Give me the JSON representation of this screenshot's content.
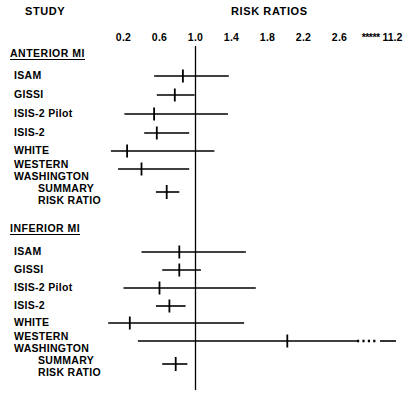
{
  "header": {
    "study_label": "STUDY",
    "risk_ratios_label": "RISK RATIOS"
  },
  "axis": {
    "tick_labels": [
      "0.2",
      "0.6",
      "1.0",
      "1.4",
      "1.8",
      "2.2",
      "2.6"
    ],
    "tick_values": [
      0.2,
      0.6,
      1.0,
      1.4,
      1.8,
      2.2,
      2.6
    ],
    "break_marker": "*****",
    "break_label": "11.2",
    "reference_value": 1.0
  },
  "groups": [
    {
      "title": "ANTERIOR MI",
      "rows": [
        {
          "label": "ISAM",
          "estimate": 0.86,
          "low": 0.54,
          "high": 1.37
        },
        {
          "label": "GISSI",
          "estimate": 0.77,
          "low": 0.57,
          "high": 0.99
        },
        {
          "label": "ISIS-2 Pilot",
          "estimate": 0.54,
          "low": 0.21,
          "high": 1.36
        },
        {
          "label": "ISIS-2",
          "estimate": 0.57,
          "low": 0.43,
          "high": 0.93
        },
        {
          "label": "WHITE",
          "estimate": 0.24,
          "low": 0.06,
          "high": 1.21
        },
        {
          "label": "WESTERN\nWASHINGTON",
          "estimate": 0.4,
          "low": 0.14,
          "high": 0.93
        }
      ],
      "summary": {
        "label": "SUMMARY\nRISK RATIO",
        "estimate": 0.68,
        "low": 0.56,
        "high": 0.82
      }
    },
    {
      "title": "INFERIOR MI",
      "rows": [
        {
          "label": "ISAM",
          "estimate": 0.82,
          "low": 0.4,
          "high": 1.56
        },
        {
          "label": "GISSI",
          "estimate": 0.82,
          "low": 0.63,
          "high": 1.06
        },
        {
          "label": "ISIS-2 Pilot",
          "estimate": 0.6,
          "low": 0.2,
          "high": 1.67
        },
        {
          "label": "ISIS-2",
          "estimate": 0.71,
          "low": 0.56,
          "high": 0.89
        },
        {
          "label": "WHITE",
          "estimate": 0.27,
          "low": 0.03,
          "high": 1.54
        },
        {
          "label": "WESTERN\nWASHINGTON",
          "estimate": 2.02,
          "low": 0.36,
          "high": 11.2,
          "truncated": true
        }
      ],
      "summary": {
        "label": "SUMMARY\nRISK RATIO",
        "estimate": 0.78,
        "low": 0.63,
        "high": 0.91
      }
    }
  ],
  "chart_data": {
    "type": "forest",
    "title": "RISK RATIOS",
    "xlabel": "",
    "ylabel": "STUDY",
    "xlim": [
      0.06,
      2.9
    ],
    "reference_line": 1.0,
    "axis_ticks": [
      0.2,
      0.6,
      1.0,
      1.4,
      1.8,
      2.2,
      2.6
    ],
    "axis_tick_labels": [
      "0.2",
      "0.6",
      "1.0",
      "1.4",
      "1.8",
      "2.2",
      "2.6"
    ],
    "axis_break": {
      "marker": "*****",
      "label": "11.2",
      "value": 11.2
    },
    "grid": false,
    "legend": "none",
    "series": [
      {
        "name": "ANTERIOR MI",
        "points": [
          {
            "label": "ISAM",
            "estimate": 0.86,
            "ci_low": 0.54,
            "ci_high": 1.37
          },
          {
            "label": "GISSI",
            "estimate": 0.77,
            "ci_low": 0.57,
            "ci_high": 0.99
          },
          {
            "label": "ISIS-2 Pilot",
            "estimate": 0.54,
            "ci_low": 0.21,
            "ci_high": 1.36
          },
          {
            "label": "ISIS-2",
            "estimate": 0.57,
            "ci_low": 0.43,
            "ci_high": 0.93
          },
          {
            "label": "WHITE",
            "estimate": 0.24,
            "ci_low": 0.06,
            "ci_high": 1.21
          },
          {
            "label": "WESTERN WASHINGTON",
            "estimate": 0.4,
            "ci_low": 0.14,
            "ci_high": 0.93
          },
          {
            "label": "SUMMARY RISK RATIO",
            "estimate": 0.68,
            "ci_low": 0.56,
            "ci_high": 0.82,
            "summary": true
          }
        ]
      },
      {
        "name": "INFERIOR MI",
        "points": [
          {
            "label": "ISAM",
            "estimate": 0.82,
            "ci_low": 0.4,
            "ci_high": 1.56
          },
          {
            "label": "GISSI",
            "estimate": 0.82,
            "ci_low": 0.63,
            "ci_high": 1.06
          },
          {
            "label": "ISIS-2 Pilot",
            "estimate": 0.6,
            "ci_low": 0.2,
            "ci_high": 1.67
          },
          {
            "label": "ISIS-2",
            "estimate": 0.71,
            "ci_low": 0.56,
            "ci_high": 0.89
          },
          {
            "label": "WHITE",
            "estimate": 0.27,
            "ci_low": 0.03,
            "ci_high": 1.54
          },
          {
            "label": "WESTERN WASHINGTON",
            "estimate": 2.02,
            "ci_low": 0.36,
            "ci_high": 11.2,
            "truncated": true
          },
          {
            "label": "SUMMARY RISK RATIO",
            "estimate": 0.78,
            "ci_low": 0.63,
            "ci_high": 0.91,
            "summary": true
          }
        ]
      }
    ]
  },
  "colors": {
    "ink": "#000000",
    "background": "#ffffff"
  }
}
